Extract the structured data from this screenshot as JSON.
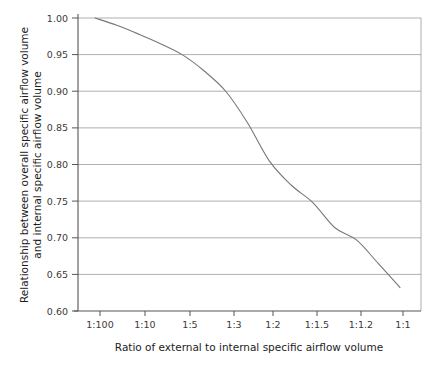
{
  "chart_data": {
    "type": "line",
    "title": "",
    "xlabel": "Ratio of external to internal specific airflow volume",
    "ylabel": "Relationship between overall specific airflow volume and internal specific airflow volume",
    "ylabel_line1": "Relationship between overall specific airflow volume",
    "ylabel_line2": "and internal specific airflow volume",
    "x_tick_labels": [
      "1:100",
      "1:10",
      "1:5",
      "1:3",
      "1:2",
      "1:1.5",
      "1:1.2",
      "1:1"
    ],
    "x_tick_values": [
      0.01,
      0.1,
      0.2,
      0.3333,
      0.5,
      0.6667,
      0.8333,
      1.0
    ],
    "y_tick_labels": [
      "1.00",
      "0.95",
      "0.90",
      "0.85",
      "0.80",
      "0.75",
      "0.70",
      "0.65",
      "0.60"
    ],
    "y_tick_values": [
      1.0,
      0.95,
      0.9,
      0.85,
      0.8,
      0.75,
      0.7,
      0.65,
      0.6
    ],
    "ylim": [
      0.6,
      1.0
    ],
    "grid": "horizontal",
    "legend": "none",
    "series": [
      {
        "name": "Overall to internal specific airflow volume ratio",
        "color": "#777777",
        "points": [
          {
            "x_label": "1:100",
            "y": 1.0
          },
          {
            "x_label": "1:20",
            "y": 0.99
          },
          {
            "x_label": "1:10",
            "y": 0.978
          },
          {
            "x_label": "1:7",
            "y": 0.965
          },
          {
            "x_label": "1:5",
            "y": 0.95
          },
          {
            "x_label": "1:4",
            "y": 0.928
          },
          {
            "x_label": "1:3",
            "y": 0.9
          },
          {
            "x_label": "1:2.5",
            "y": 0.857
          },
          {
            "x_label": "1:2",
            "y": 0.805
          },
          {
            "x_label": "1:1.7",
            "y": 0.772
          },
          {
            "x_label": "1:1.5",
            "y": 0.748
          },
          {
            "x_label": "1:1.3",
            "y": 0.714
          },
          {
            "x_label": "1:1.2",
            "y": 0.697
          },
          {
            "x_label": "1:1.1",
            "y": 0.665
          },
          {
            "x_label": "1:1",
            "y": 0.632
          }
        ]
      }
    ],
    "annotations": [],
    "colors": {
      "curve": "#777777",
      "grid": "#9a9a9a",
      "axis": "#555555",
      "text": "#222222",
      "background": "#ffffff"
    }
  }
}
